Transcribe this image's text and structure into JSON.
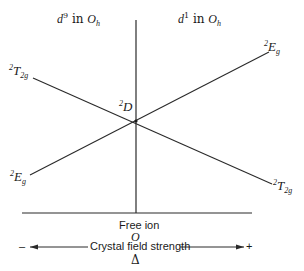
{
  "diagram": {
    "title_left": {
      "d": "d",
      "sup": "9",
      "in": "in",
      "O": "O",
      "sub": "h"
    },
    "title_right": {
      "d": "d",
      "sup": "1",
      "in": "in",
      "O": "O",
      "sub": "h"
    },
    "center_term": {
      "sup": "2",
      "main": "D"
    },
    "terms": {
      "top_left": {
        "sup": "2",
        "main": "T",
        "sub": "2g"
      },
      "top_right": {
        "sup": "2",
        "main": "E",
        "sub": "g"
      },
      "bottom_left": {
        "sup": "2",
        "main": "E",
        "sub": "g"
      },
      "bottom_right": {
        "sup": "2",
        "main": "T",
        "sub": "2g"
      }
    },
    "free_ion_label": "Free ion",
    "origin_label": "O",
    "axis": {
      "minus": "–",
      "label": "Crystal field strength",
      "plus": "+",
      "delta": "Δ"
    },
    "colors": {
      "line": "#2a2a2a",
      "background": "#ffffff"
    }
  }
}
